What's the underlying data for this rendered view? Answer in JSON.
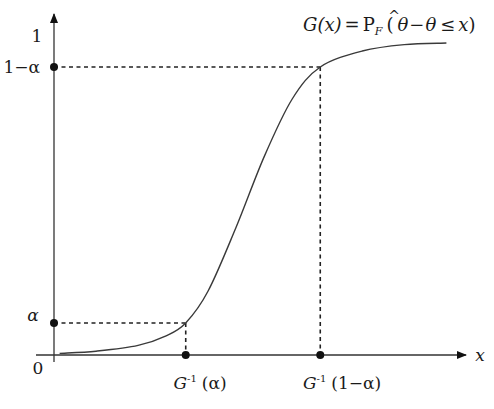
{
  "chart_data": {
    "type": "line",
    "formula": {
      "lhs": "G(x)",
      "eq": "=",
      "p": "P",
      "sub": "F",
      "open": "(",
      "theta_hat": "θ",
      "hat": "^",
      "minus": "−",
      "theta": "θ",
      "leq": "≤",
      "x": "x",
      "close": ")"
    },
    "xlabel": "x",
    "ylabel": "",
    "origin_label": "0",
    "y_ticks": [
      {
        "label": "1",
        "value": 1.0
      },
      {
        "label": "1−α",
        "value": 0.9
      },
      {
        "label": "α",
        "value": 0.1
      }
    ],
    "x_ticks": [
      {
        "label_main": "G",
        "label_sup": "-1",
        "label_arg": "(α)",
        "value": 0.47
      },
      {
        "label_main": "G",
        "label_sup": "-1",
        "label_arg": "(1−α)",
        "value": 0.95
      }
    ],
    "ylim": [
      0,
      1.05
    ],
    "xlim": [
      0,
      1.47
    ],
    "series": [
      {
        "name": "G(x)",
        "description": "S-shaped cumulative distribution curve",
        "x": [
          0.02,
          0.15,
          0.3,
          0.4,
          0.47,
          0.55,
          0.65,
          0.75,
          0.85,
          0.95,
          1.1,
          1.25,
          1.4
        ],
        "y": [
          0.005,
          0.012,
          0.03,
          0.06,
          0.1,
          0.2,
          0.4,
          0.62,
          0.8,
          0.9,
          0.95,
          0.97,
          0.975
        ]
      }
    ],
    "reference_points": [
      {
        "name": "alpha-quantile",
        "x": 0.47,
        "y": 0.1
      },
      {
        "name": "one-minus-alpha-quantile",
        "x": 0.95,
        "y": 0.9
      }
    ],
    "grid": false,
    "legend": "none"
  }
}
